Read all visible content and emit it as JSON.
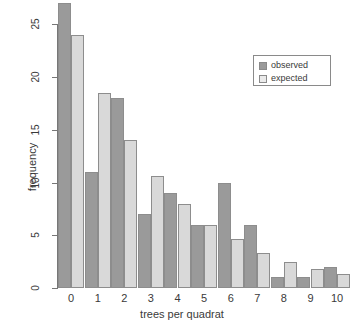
{
  "chart_data": {
    "type": "bar",
    "title": "",
    "xlabel": "trees per quadrat",
    "ylabel": "frequency",
    "categories": [
      "0",
      "1",
      "2",
      "3",
      "4",
      "5",
      "6",
      "7",
      "8",
      "9",
      "10"
    ],
    "series": [
      {
        "name": "observed",
        "color": "#9a9a9a",
        "values": [
          27,
          11,
          18,
          7,
          9,
          6,
          10,
          6,
          1,
          1,
          2
        ]
      },
      {
        "name": "expected",
        "color": "#d9d9d9",
        "values": [
          24,
          18.5,
          14,
          10.6,
          8,
          6,
          4.6,
          3.3,
          2.5,
          1.8,
          1.3
        ]
      }
    ],
    "ylim": [
      0,
      27
    ],
    "yticks": [
      "0",
      "5",
      "10",
      "15",
      "20",
      "25"
    ],
    "ytick_values": [
      0,
      5,
      10,
      15,
      20,
      25
    ],
    "grid": false,
    "legend_position": "top-right"
  },
  "legend": {
    "items": [
      {
        "label": "observed",
        "swatch": "observed"
      },
      {
        "label": "expected",
        "swatch": "expected"
      }
    ]
  }
}
